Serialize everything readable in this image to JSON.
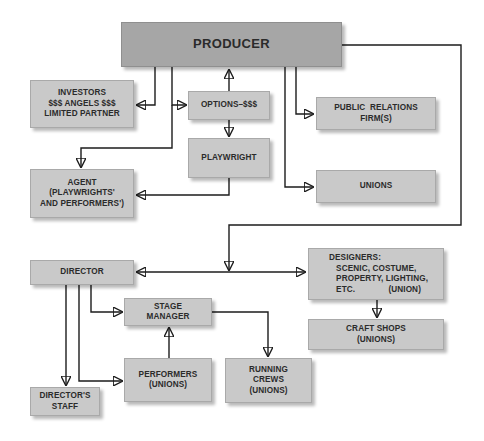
{
  "diagram": {
    "type": "organizational-chart",
    "colors": {
      "producer_fill": "#a6a6a6",
      "box_fill": "#c9c9c9",
      "line": "#1c1c1c",
      "text": "#2b2b2b",
      "background": "#ffffff"
    },
    "nodes": {
      "producer": {
        "lines": [
          "PRODUCER"
        ]
      },
      "investors": {
        "lines": [
          "INVESTORS",
          "$$$ ANGELS $$$",
          "LIMITED PARTNER"
        ]
      },
      "options": {
        "lines": [
          "OPTIONS–$$$"
        ]
      },
      "playwright": {
        "lines": [
          "PLAYWRIGHT"
        ]
      },
      "public_relations": {
        "lines": [
          "PUBLIC  RELATIONS",
          "FIRM(S)"
        ]
      },
      "unions": {
        "lines": [
          "UNIONS"
        ]
      },
      "agent": {
        "lines": [
          "AGENT",
          "(PLAYWRIGHTS'",
          "AND PERFORMERS')"
        ]
      },
      "director": {
        "lines": [
          "DIRECTOR"
        ]
      },
      "designers": {
        "lines": [
          "DESIGNERS:",
          "   SCENIC, COSTUME,",
          "   PROPERTY, LIGHTING,",
          "   ETC.              (UNION)"
        ]
      },
      "craft_shops": {
        "lines": [
          "CRAFT SHOPS",
          "(UNIONS)"
        ]
      },
      "stage_manager": {
        "lines": [
          "STAGE",
          "MANAGER"
        ]
      },
      "performers": {
        "lines": [
          "PERFORMERS",
          "(UNIONS)"
        ]
      },
      "running_crews": {
        "lines": [
          "RUNNING",
          "CREWS",
          "(UNIONS)"
        ]
      },
      "directors_staff": {
        "lines": [
          "DIRECTOR'S",
          "STAFF"
        ]
      }
    },
    "edges": [
      {
        "from": "producer",
        "to": "investors"
      },
      {
        "from": "producer",
        "to": "options"
      },
      {
        "from": "options",
        "to": "producer"
      },
      {
        "from": "options",
        "to": "playwright"
      },
      {
        "from": "producer",
        "to": "agent"
      },
      {
        "from": "playwright",
        "to": "agent"
      },
      {
        "from": "producer",
        "to": "public_relations"
      },
      {
        "from": "producer",
        "to": "unions"
      },
      {
        "from": "producer",
        "to": "director"
      },
      {
        "from": "producer",
        "to": "designers"
      },
      {
        "from": "designers",
        "to": "director"
      },
      {
        "from": "director",
        "to": "designers"
      },
      {
        "from": "designers",
        "to": "craft_shops"
      },
      {
        "from": "director",
        "to": "stage_manager"
      },
      {
        "from": "director",
        "to": "performers"
      },
      {
        "from": "director",
        "to": "directors_staff"
      },
      {
        "from": "performers",
        "to": "stage_manager"
      },
      {
        "from": "stage_manager",
        "to": "running_crews"
      }
    ]
  }
}
